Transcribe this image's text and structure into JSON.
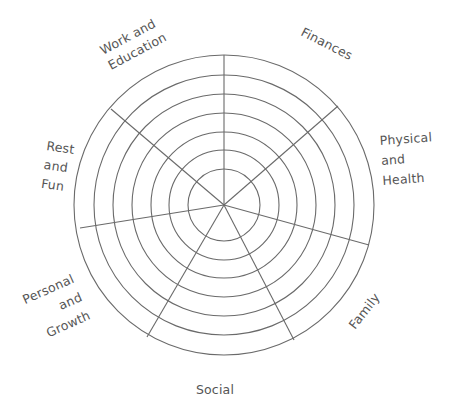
{
  "wheel": {
    "center": [
      224,
      205
    ],
    "ring_radii": [
      36,
      55,
      73,
      92,
      111,
      130,
      150
    ],
    "line_color": "#6a6a6a",
    "text_color": "#555555",
    "spokes": [
      {
        "end": [
          224,
          55
        ]
      },
      {
        "end": [
          338,
          106
        ]
      },
      {
        "end": [
          369,
          245
        ]
      },
      {
        "end": [
          294,
          340
        ]
      },
      {
        "end": [
          147,
          337
        ]
      },
      {
        "end": [
          80,
          228
        ]
      },
      {
        "end": [
          111,
          109
        ]
      }
    ],
    "segments": [
      {
        "name": "Finances",
        "lines": [
          "Finances"
        ],
        "x": 300,
        "y": 35,
        "rotate": 27,
        "anchor": "start",
        "line_height": 14
      },
      {
        "name": "Physical and Health",
        "lines": [
          "Physical",
          "and",
          "Health"
        ],
        "x": 380,
        "y": 145,
        "rotate": -4,
        "anchor": "start",
        "line_height": 20
      },
      {
        "name": "Family",
        "lines": [
          "Family"
        ],
        "x": 355,
        "y": 330,
        "rotate": -52,
        "anchor": "start",
        "line_height": 14
      },
      {
        "name": "Social",
        "lines": [
          "Social"
        ],
        "x": 215,
        "y": 394,
        "rotate": 0,
        "anchor": "middle",
        "line_height": 14
      },
      {
        "name": "Personal and Growth",
        "lines": [
          "Personal",
          "and",
          "Growth"
        ],
        "x": 75,
        "y": 282,
        "rotate": -24,
        "anchor": "end",
        "line_height": 20
      },
      {
        "name": "Rest and Fun",
        "lines": [
          "Rest",
          "and",
          "Fun"
        ],
        "x": 46,
        "y": 150,
        "rotate": 8,
        "anchor": "start",
        "line_height": 19
      },
      {
        "name": "Work and Education",
        "lines": [
          "Work and",
          "Education"
        ],
        "x": 103,
        "y": 55,
        "rotate": -28,
        "anchor": "start",
        "line_height": 17
      }
    ]
  }
}
